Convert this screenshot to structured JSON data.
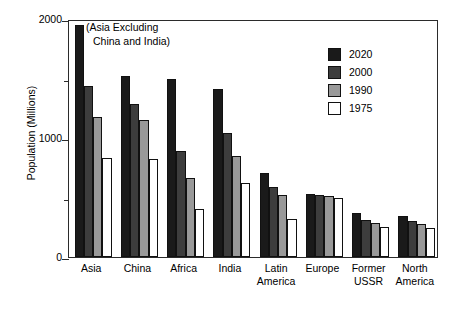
{
  "chart_data": {
    "type": "bar",
    "title": "",
    "xlabel": "",
    "ylabel": "Population (Millions)",
    "ylim": [
      0,
      2000
    ],
    "yticks": [
      0,
      1000,
      2000
    ],
    "ytick_labels": [
      "0",
      "1000",
      "2000"
    ],
    "yminor_ticks": [
      500,
      1500
    ],
    "grid": false,
    "legend_position": "top-right",
    "annotation": {
      "line1": "(Asia Excluding",
      "line2": "China and India)"
    },
    "categories": [
      "Asia",
      "China",
      "Africa",
      "India",
      "Latin America",
      "Europe",
      "Former USSR",
      "North America"
    ],
    "category_lines": [
      [
        "Asia"
      ],
      [
        "China"
      ],
      [
        "Africa"
      ],
      [
        "India"
      ],
      [
        "Latin",
        "America"
      ],
      [
        "Europe"
      ],
      [
        "Former",
        "USSR"
      ],
      [
        "North",
        "America"
      ]
    ],
    "series": [
      {
        "name": "2020",
        "color": "#1a1a1a",
        "values": [
          1950,
          1520,
          1500,
          1410,
          710,
          530,
          370,
          345
        ]
      },
      {
        "name": "2000",
        "color": "#3d3d3d",
        "values": [
          1440,
          1290,
          890,
          1040,
          590,
          525,
          310,
          305
        ]
      },
      {
        "name": "1990",
        "color": "#999999",
        "values": [
          1180,
          1150,
          660,
          850,
          520,
          515,
          290,
          280
        ]
      },
      {
        "name": "1975",
        "color": "#ffffff",
        "values": [
          830,
          825,
          400,
          620,
          320,
          495,
          250,
          240
        ]
      }
    ]
  },
  "colors": {
    "axis": "#2b2b2b",
    "bar_outline": "#111111",
    "background": "#ffffff",
    "text": "#000000"
  }
}
